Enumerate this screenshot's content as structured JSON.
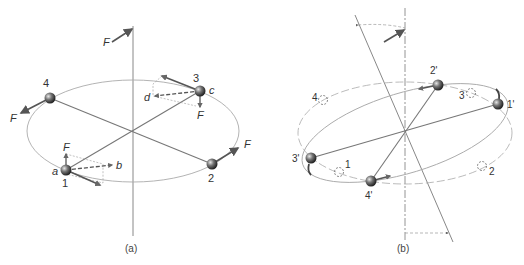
{
  "panel_a": {
    "caption": "(a)",
    "force_label_top": "F",
    "masses": [
      {
        "id": "1",
        "label": "1",
        "point_label": "a"
      },
      {
        "id": "2",
        "label": "2"
      },
      {
        "id": "3",
        "label": "3",
        "point_label": "c"
      },
      {
        "id": "4",
        "label": "4"
      }
    ],
    "labels": {
      "b": "b",
      "d": "d",
      "F1": "F",
      "F2": "F",
      "F3": "F",
      "F4": "F"
    }
  },
  "panel_b": {
    "caption": "(b)",
    "new_positions": [
      {
        "id": "1p",
        "label": "1'"
      },
      {
        "id": "2p",
        "label": "2'"
      },
      {
        "id": "3p",
        "label": "3'"
      },
      {
        "id": "4p",
        "label": "4'"
      }
    ],
    "old_positions": [
      {
        "id": "1",
        "label": "1"
      },
      {
        "id": "2",
        "label": "2"
      },
      {
        "id": "3",
        "label": "3"
      },
      {
        "id": "4",
        "label": "4"
      }
    ]
  },
  "colors": {
    "axis": "#888888",
    "orbit": "#aaaaaa",
    "rod": "#777777",
    "arrow": "#555555",
    "mass": "#555555"
  }
}
